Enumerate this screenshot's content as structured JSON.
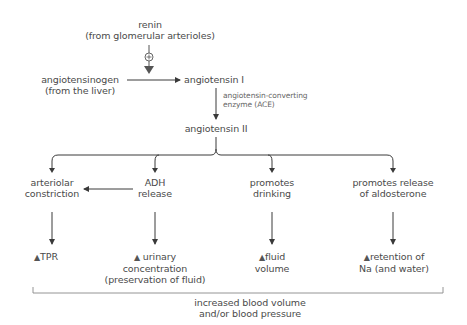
{
  "diagram": {
    "colors": {
      "line": "#3a3a3a",
      "text": "#4a4a4a",
      "enzyme_text": "#666666",
      "renin_arrow": "#555555"
    },
    "nodes": {
      "renin": {
        "line1": "renin",
        "line2": "(from glomerular arterioles)"
      },
      "stimulation_symbol": "⊕",
      "angiotensinogen": {
        "line1": "angiotensinogen",
        "line2": "(from the liver)"
      },
      "angiotensin_i": {
        "line1": "angiotensin I"
      },
      "ace": {
        "line1": "angiotensin-converting",
        "line2": "enzyme (ACE)"
      },
      "angiotensin_ii": {
        "line1": "angiotensin II"
      },
      "effects": [
        {
          "line1": "arteriolar",
          "line2": "constriction"
        },
        {
          "line1": "ADH",
          "line2": "release"
        },
        {
          "line1": "promotes",
          "line2": "drinking"
        },
        {
          "line1": "promotes release",
          "line2": "of aldosterone"
        }
      ],
      "outcomes": [
        {
          "symbol": "▲",
          "line1": "TPR"
        },
        {
          "symbol": "▲",
          "line1": "urinary",
          "line2": "concentration",
          "line3": "(preservation of fluid)"
        },
        {
          "symbol": "▲",
          "line1": "fluid",
          "line2": "volume"
        },
        {
          "symbol": "▲",
          "line1": "retention of",
          "line2": "Na (and water)"
        }
      ],
      "summary": {
        "line1": "increased blood volume",
        "line2": "and/or blood pressure"
      }
    }
  }
}
